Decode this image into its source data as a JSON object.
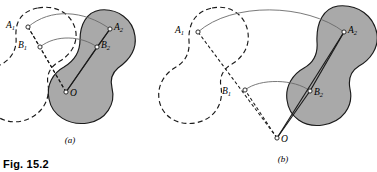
{
  "figure": {
    "caption": "Fig. 15.2",
    "panels": [
      {
        "id": "a",
        "label": "(a)",
        "label_pos": {
          "x": 70,
          "y": 143
        },
        "points": [
          {
            "name": "A1",
            "letter": "A",
            "sub": "1",
            "x": 28,
            "y": 27,
            "label_dx": -13,
            "label_dy": 1
          },
          {
            "name": "B1",
            "letter": "B",
            "sub": "1",
            "x": 40,
            "y": 47,
            "label_dx": -13,
            "label_dy": 1
          },
          {
            "name": "A2",
            "letter": "A",
            "sub": "2",
            "x": 110,
            "y": 29,
            "label_dx": 4,
            "label_dy": 1
          },
          {
            "name": "B2",
            "letter": "B",
            "sub": "2",
            "x": 97,
            "y": 47,
            "label_dx": 4,
            "label_dy": 1
          },
          {
            "name": "O",
            "letter": "O",
            "sub": "",
            "x": 66,
            "y": 92,
            "label_dx": 4,
            "label_dy": 4
          }
        ],
        "shaded_body_outline": "M 100 10 C 118 8 133 20 135 36 C 137 50 128 61 118 68 C 112 73 110 80 112 88 C 116 104 106 120 88 123 C 68 126 52 115 49 99 C 46 85 53 73 64 67 C 74 61 80 52 80 40 C 80 24 87 12 100 10 Z",
        "dashed_body_outline": "M 38 8 C 58 4 74 16 76 33 C 77 45 70 55 60 61 C 51 66 46 74 48 84 C 51 101 40 117 22 121 C 4 125 -12 114 -15 98 C -18 83 -9 70 2 64 C 12 58 17 49 16 37 C 15 21 22 11 38 8 Z"
      },
      {
        "id": "b",
        "label": "(b)",
        "label_pos": {
          "x": 283,
          "y": 162
        },
        "points": [
          {
            "name": "A1",
            "letter": "A",
            "sub": "1",
            "x": 198,
            "y": 32,
            "label_dx": -14,
            "label_dy": 1
          },
          {
            "name": "B1",
            "letter": "B",
            "sub": "1",
            "x": 245,
            "y": 90,
            "label_dx": -14,
            "label_dy": 4
          },
          {
            "name": "A2",
            "letter": "A",
            "sub": "2",
            "x": 344,
            "y": 32,
            "label_dx": 4,
            "label_dy": 1
          },
          {
            "name": "B2",
            "letter": "B",
            "sub": "2",
            "x": 310,
            "y": 91,
            "label_dx": 4,
            "label_dy": 4
          },
          {
            "name": "O",
            "letter": "O",
            "sub": "",
            "x": 277,
            "y": 138,
            "label_dx": 4,
            "label_dy": 4
          }
        ],
        "shaded_body_outline": "M 338 6 C 358 4 374 16 377 34 C 379 48 370 60 359 66 C 351 71 348 79 350 89 C 354 107 342 122 323 125 C 304 128 289 117 287 100 C 285 86 293 74 304 68 C 313 63 318 54 317 42 C 316 22 324 8 338 6 Z",
        "dashed_body_outline": "M 212 8 C 231 4 246 16 248 33 C 250 47 242 58 232 64 C 223 69 219 77 221 87 C 224 105 213 120 195 123 C 176 126 161 115 159 99 C 157 85 165 73 176 67 C 185 62 190 53 189 41 C 188 22 197 11 212 8 Z"
      }
    ]
  },
  "colors": {
    "shaded_fill": "#a9a9a9",
    "solid_stroke": "#1a1a1a",
    "dashed_stroke": "#1a1a1a",
    "arc_stroke": "#6a6a6a",
    "marker_fill": "#ffffff",
    "background": "#ffffff"
  }
}
